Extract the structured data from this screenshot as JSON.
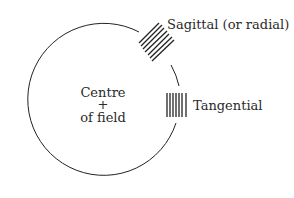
{
  "diagram": {
    "labels": {
      "sagittal": "Sagittal (or radial)",
      "tangential": "Tangential",
      "centre_line1": "Centre",
      "centre_mark": "+",
      "centre_line2": "of field"
    },
    "colors": {
      "stroke": "#222222",
      "background": "#ffffff"
    }
  }
}
